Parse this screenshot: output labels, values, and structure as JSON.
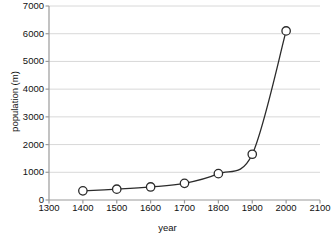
{
  "chart_data": {
    "type": "line",
    "title": "",
    "xlabel": "year",
    "ylabel": "population (m)",
    "xlim": [
      1300,
      2100
    ],
    "ylim": [
      0,
      7000
    ],
    "grid": "horizontal",
    "legend": "none",
    "marker": "open-circle",
    "x": [
      1400,
      1500,
      1600,
      1700,
      1800,
      1900,
      2000
    ],
    "values": [
      330,
      390,
      470,
      600,
      950,
      1650,
      6100
    ],
    "xticks": [
      "1300",
      "1400",
      "1500",
      "1600",
      "1700",
      "1800",
      "1900",
      "2000",
      "2100"
    ],
    "xtick_values": [
      1300,
      1400,
      1500,
      1600,
      1700,
      1800,
      1900,
      2000,
      2100
    ],
    "yticks": [
      "0",
      "1000",
      "2000",
      "3000",
      "4000",
      "5000",
      "6000",
      "7000"
    ],
    "ytick_values": [
      0,
      1000,
      2000,
      3000,
      4000,
      5000,
      6000,
      7000
    ],
    "colors": {
      "line": "#2b2b2b",
      "marker_fill": "#ffffff",
      "marker_stroke": "#2b2b2b",
      "grid": "#d8d8d8",
      "axis": "#9a9a9a",
      "text": "#111111",
      "background": "#ffffff"
    }
  }
}
